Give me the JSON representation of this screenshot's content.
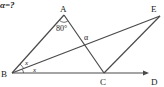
{
  "question": "α=?",
  "points": {
    "A": {
      "label": "A",
      "x": 64,
      "y": 15
    },
    "B": {
      "label": "B",
      "x": 12,
      "y": 73
    },
    "C": {
      "label": "C",
      "x": 104,
      "y": 73
    },
    "D": {
      "label": "D",
      "x": 148,
      "y": 73
    },
    "E": {
      "label": "E",
      "x": 160,
      "y": 16
    }
  },
  "angles": {
    "A": "80°",
    "alpha": "α",
    "x_upper": "x",
    "x_lower": "x"
  },
  "colors": {
    "line": "#4a4a4a",
    "text": "#222222"
  }
}
